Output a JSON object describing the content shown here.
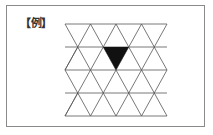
{
  "figure": {
    "label": "【例】",
    "grid": {
      "rows": 4,
      "x0": 65,
      "x1": 167,
      "y0": 24,
      "row_height": 23,
      "cell_width": 25.5,
      "line_color": "#555555"
    },
    "highlight": {
      "description": "filled downward-pointing triangle",
      "points": [
        [
          103.25,
          47
        ],
        [
          128.75,
          47
        ],
        [
          116,
          70
        ]
      ],
      "fill": "#111111"
    }
  }
}
